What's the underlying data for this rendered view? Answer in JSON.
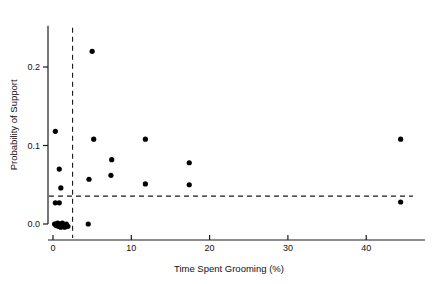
{
  "chart_data": {
    "type": "scatter",
    "title": "",
    "xlabel": "Time Spent Grooming (%)",
    "ylabel": "Probability of Support",
    "xlim": [
      -1.5,
      47.5
    ],
    "ylim": [
      -0.012,
      0.245
    ],
    "xticks": [
      0,
      10,
      20,
      30,
      40
    ],
    "xticklabels": [
      "0",
      "10",
      "20",
      "30",
      "40"
    ],
    "yticks": [
      0.0,
      0.1,
      0.2
    ],
    "yticklabels": [
      "0.0",
      "0.1",
      "0.2"
    ],
    "grid": false,
    "legend": null,
    "marker": "filled-circle",
    "marker_color": "#000000",
    "points": [
      {
        "x": 0.2,
        "y": 0.0
      },
      {
        "x": 0.3,
        "y": 0.0
      },
      {
        "x": 0.4,
        "y": -0.002
      },
      {
        "x": 0.6,
        "y": 0.001
      },
      {
        "x": 0.7,
        "y": -0.003
      },
      {
        "x": 0.9,
        "y": 0.0
      },
      {
        "x": 1.0,
        "y": -0.004
      },
      {
        "x": 1.2,
        "y": 0.001
      },
      {
        "x": 1.3,
        "y": -0.002
      },
      {
        "x": 1.5,
        "y": -0.004
      },
      {
        "x": 1.7,
        "y": 0.0
      },
      {
        "x": 1.9,
        "y": -0.003
      },
      {
        "x": 0.3,
        "y": 0.027
      },
      {
        "x": 0.8,
        "y": 0.027
      },
      {
        "x": 1.0,
        "y": 0.046
      },
      {
        "x": 0.8,
        "y": 0.07
      },
      {
        "x": 0.3,
        "y": 0.118
      },
      {
        "x": 4.5,
        "y": 0.0
      },
      {
        "x": 4.6,
        "y": 0.057
      },
      {
        "x": 5.2,
        "y": 0.108
      },
      {
        "x": 5.0,
        "y": 0.22
      },
      {
        "x": 7.4,
        "y": 0.062
      },
      {
        "x": 7.5,
        "y": 0.082
      },
      {
        "x": 11.8,
        "y": 0.051
      },
      {
        "x": 11.8,
        "y": 0.108
      },
      {
        "x": 17.4,
        "y": 0.05
      },
      {
        "x": 17.4,
        "y": 0.078
      },
      {
        "x": 44.4,
        "y": 0.028
      },
      {
        "x": 44.4,
        "y": 0.108
      }
    ],
    "reference_lines": [
      {
        "orientation": "vertical",
        "value": 2.5,
        "style": "dashed"
      },
      {
        "orientation": "horizontal",
        "value": 0.0355,
        "style": "dashed"
      }
    ]
  }
}
